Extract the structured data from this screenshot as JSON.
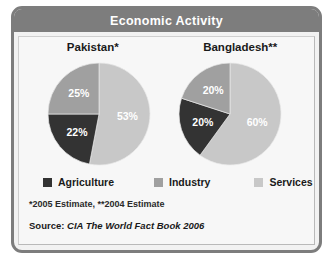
{
  "header": {
    "title": "Economic Activity"
  },
  "colors": {
    "agriculture": "#333333",
    "industry": "#a0a0a0",
    "services": "#c8c8c8",
    "frame": "#7d7d7d",
    "panel_bg": "#f7f7f7",
    "header_text": "#ffffff"
  },
  "legend": {
    "items": [
      {
        "label": "Agriculture",
        "color": "#333333"
      },
      {
        "label": "Industry",
        "color": "#a0a0a0"
      },
      {
        "label": "Services",
        "color": "#c8c8c8"
      }
    ]
  },
  "footnote": "*2005 Estimate, **2004 Estimate",
  "source": {
    "label": "Source:",
    "text": "CIA The World Fact Book 2006"
  },
  "chart_data": [
    {
      "type": "pie",
      "title": "Pakistan*",
      "categories": [
        "Services",
        "Agriculture",
        "Industry"
      ],
      "values": [
        53,
        25,
        22
      ],
      "labels": [
        "53%",
        "22%",
        "25%"
      ],
      "slices": [
        {
          "name": "Services",
          "value": 53,
          "label": "53%",
          "color": "#c8c8c8"
        },
        {
          "name": "Agriculture",
          "value": 22,
          "label": "22%",
          "color": "#333333"
        },
        {
          "name": "Industry",
          "value": 25,
          "label": "25%",
          "color": "#a0a0a0"
        }
      ],
      "start_angle": 0,
      "direction": "clockwise",
      "legend_position": "bottom"
    },
    {
      "type": "pie",
      "title": "Bangladesh**",
      "categories": [
        "Services",
        "Agriculture",
        "Industry"
      ],
      "values": [
        60,
        20,
        20
      ],
      "labels": [
        "60%",
        "20%",
        "20%"
      ],
      "slices": [
        {
          "name": "Services",
          "value": 60,
          "label": "60%",
          "color": "#c8c8c8"
        },
        {
          "name": "Agriculture",
          "value": 20,
          "label": "20%",
          "color": "#333333"
        },
        {
          "name": "Industry",
          "value": 20,
          "label": "20%",
          "color": "#a0a0a0"
        }
      ],
      "start_angle": 0,
      "direction": "clockwise",
      "legend_position": "bottom"
    }
  ]
}
